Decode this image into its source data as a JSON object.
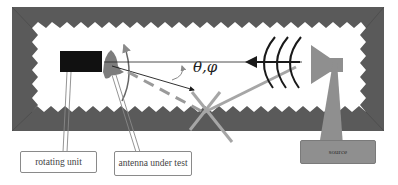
{
  "diagram": {
    "labels": {
      "rotating_unit": "rotating unit",
      "antenna_under_test": "antenna under test",
      "source": "source",
      "angle": "θ,φ"
    },
    "colors": {
      "absorber": "#5a5a5a",
      "chamber_interior": "#ffffff",
      "rotating_unit": "#111111",
      "antenna": "#7d7d7d",
      "source": "#8f8f8f",
      "direct_ray": "#1a1a1a",
      "reflected_ray": "#a6a6a6",
      "dashed_ray": "#9a9a9a",
      "wavefront": "#1a1a1a"
    }
  }
}
